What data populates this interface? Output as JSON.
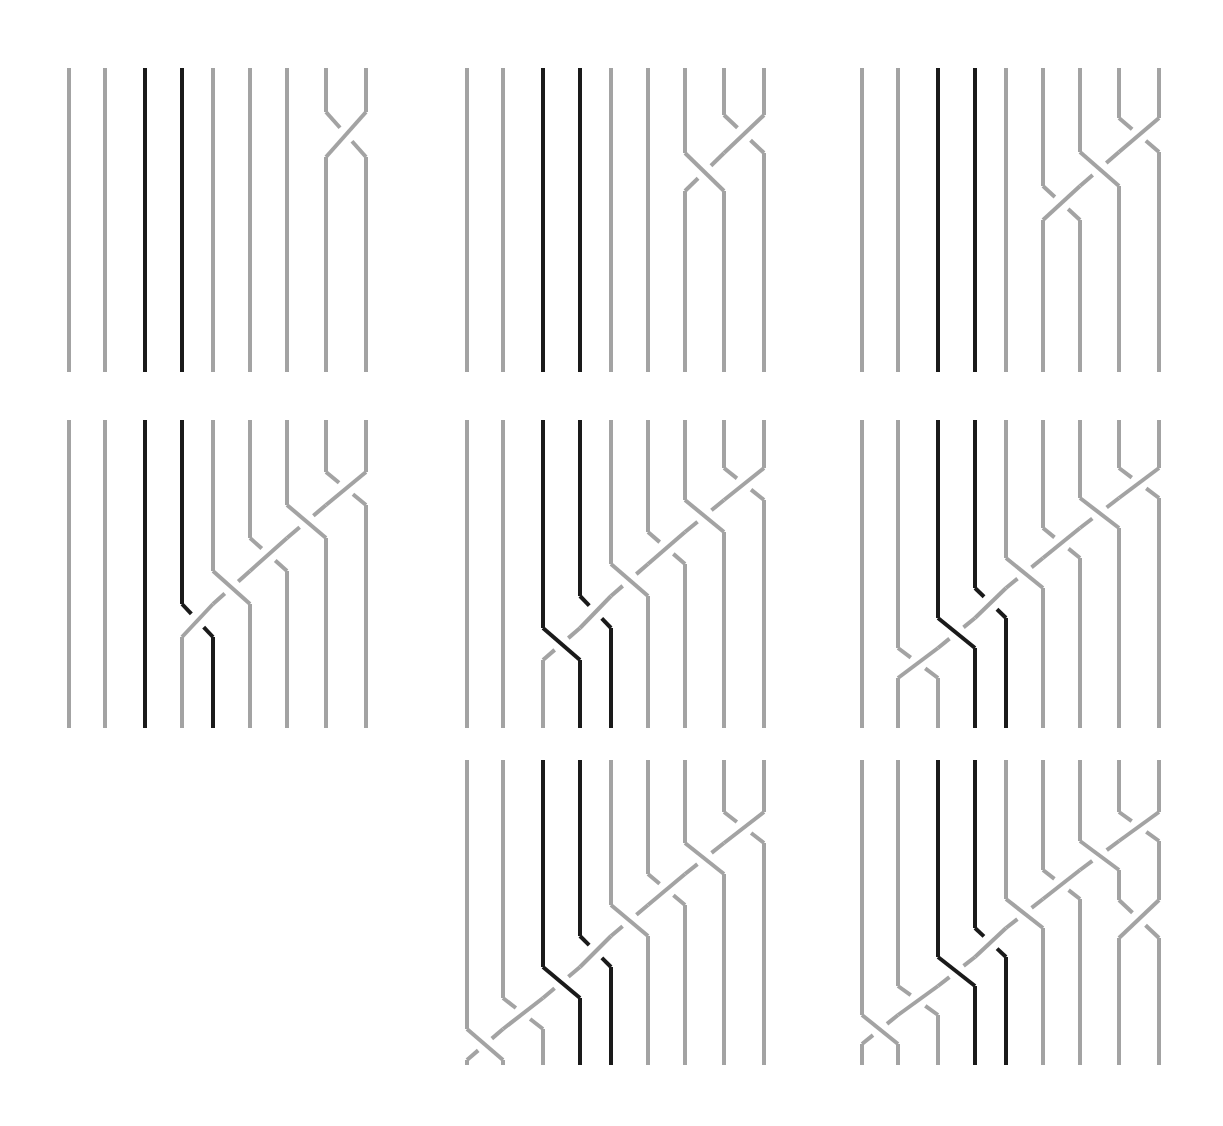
{
  "figure": {
    "title": ""
  },
  "colors": {
    "background": "#ffffff",
    "strand_gray": "#a3a3a3",
    "strand_dark": "#1a1a1a"
  },
  "layout": {
    "column_offsets": [
      0,
      36,
      76,
      113,
      144,
      181,
      218,
      257,
      297
    ],
    "dark_columns": [
      2,
      3
    ],
    "stroke_width": 4,
    "gap": 9
  },
  "panels": [
    {
      "id": 1,
      "left": 69,
      "top": 68,
      "bottom": 372,
      "target_col": 7,
      "cross_start": 112,
      "step": 45,
      "extra": null
    },
    {
      "id": 2,
      "left": 467,
      "top": 68,
      "bottom": 372,
      "target_col": 6,
      "cross_start": 115,
      "step": 38,
      "extra": null
    },
    {
      "id": 3,
      "left": 862,
      "top": 68,
      "bottom": 372,
      "target_col": 5,
      "cross_start": 118,
      "step": 34,
      "extra": null
    },
    {
      "id": 4,
      "left": 69,
      "top": 420,
      "bottom": 728,
      "target_col": 3,
      "cross_start": 472,
      "step": 33,
      "extra": null
    },
    {
      "id": 5,
      "left": 467,
      "top": 420,
      "bottom": 728,
      "target_col": 2,
      "cross_start": 468,
      "step": 32,
      "extra": null
    },
    {
      "id": 6,
      "left": 862,
      "top": 420,
      "bottom": 728,
      "target_col": 1,
      "cross_start": 468,
      "step": 30,
      "extra": null
    },
    {
      "id": 7,
      "left": 467,
      "top": 760,
      "bottom": 1065,
      "target_col": 0,
      "cross_start": 812,
      "step": 31,
      "extra": null
    },
    {
      "id": 8,
      "left": 862,
      "top": 760,
      "bottom": 1065,
      "target_col": 0,
      "cross_start": 812,
      "step": 29,
      "extra": {
        "col": 7,
        "y": 900
      }
    }
  ]
}
